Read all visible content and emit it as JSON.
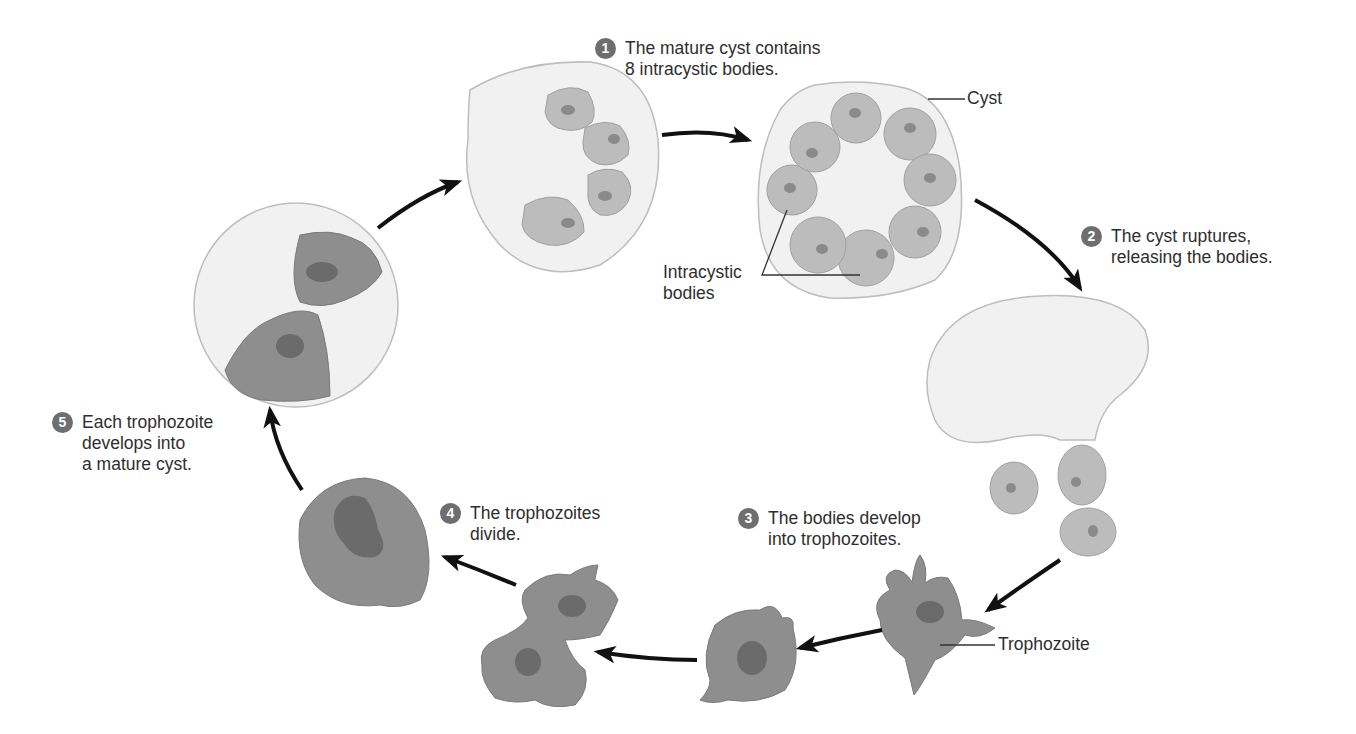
{
  "colors": {
    "cyst_fill": "#f1f1f1",
    "cyst_outline": "#bdbdbd",
    "body_fill": "#bcbcbc",
    "body_nucleus": "#8a8a8a",
    "trophozoite_fill": "#8e8e8e",
    "trophozoite_nucleus": "#6b6b6b",
    "badge": "#6e6e6e",
    "arrow": "#111111"
  },
  "steps": [
    {
      "number": "1",
      "text": "The mature cyst contains\n8 intracystic bodies."
    },
    {
      "number": "2",
      "text": "The cyst ruptures,\nreleasing the bodies."
    },
    {
      "number": "3",
      "text": "The bodies develop\ninto trophozoites."
    },
    {
      "number": "4",
      "text": "The trophozoites\ndivide."
    },
    {
      "number": "5",
      "text": "Each trophozoite\ndevelops into\na mature cyst."
    }
  ],
  "labels": {
    "cyst": "Cyst",
    "intracystic_bodies": "Intracystic\nbodies",
    "trophozoite": "Trophozoite"
  }
}
